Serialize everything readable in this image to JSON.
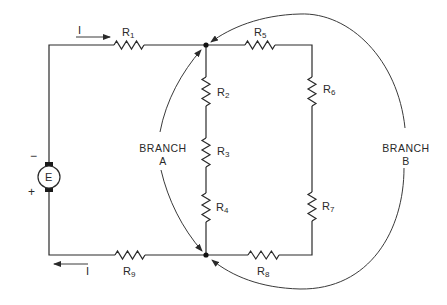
{
  "diagram": {
    "type": "series-parallel circuit",
    "source": {
      "label": "E",
      "negative_sign": "−",
      "positive_sign": "+"
    },
    "current": {
      "top_label": "I",
      "bottom_label": "I"
    },
    "resistors": [
      {
        "id": "R1",
        "base": "R",
        "sub": "1"
      },
      {
        "id": "R2",
        "base": "R",
        "sub": "2"
      },
      {
        "id": "R3",
        "base": "R",
        "sub": "3"
      },
      {
        "id": "R4",
        "base": "R",
        "sub": "4"
      },
      {
        "id": "R5",
        "base": "R",
        "sub": "5"
      },
      {
        "id": "R6",
        "base": "R",
        "sub": "6"
      },
      {
        "id": "R7",
        "base": "R",
        "sub": "7"
      },
      {
        "id": "R8",
        "base": "R",
        "sub": "8"
      },
      {
        "id": "R9",
        "base": "R",
        "sub": "9"
      }
    ],
    "branches": [
      {
        "line1": "BRANCH",
        "line2": "A"
      },
      {
        "line1": "BRANCH",
        "line2": "B"
      }
    ],
    "colors": {
      "ink": "#2a2a2a",
      "background": "#ffffff"
    }
  }
}
